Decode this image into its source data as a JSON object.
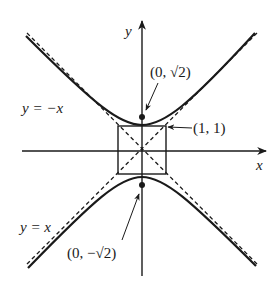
{
  "diagram": {
    "type": "hyperbola-plot",
    "equation": "y^2 - x^2 = 2",
    "axes": {
      "x_label": "x",
      "y_label": "y"
    },
    "asymptotes": [
      {
        "label": "y = −x",
        "slope": -1
      },
      {
        "label": "y = x",
        "slope": 1
      }
    ],
    "points": [
      {
        "label": "(0, √2)",
        "x": 0,
        "y": 1.414
      },
      {
        "label": "(0, −√2)",
        "x": 0,
        "y": -1.414
      },
      {
        "label": "(1, 1)",
        "x": 1,
        "y": 1
      }
    ],
    "labels": {
      "y_axis": "y",
      "x_axis": "x",
      "asym_neg": "y = −x",
      "asym_pos": "y = x",
      "top_vertex": "(0, √2)",
      "bottom_vertex": "(0, −√2)",
      "corner": "(1, 1)"
    },
    "colors": {
      "ink": "#1a1a1a",
      "background": "#ffffff"
    }
  }
}
